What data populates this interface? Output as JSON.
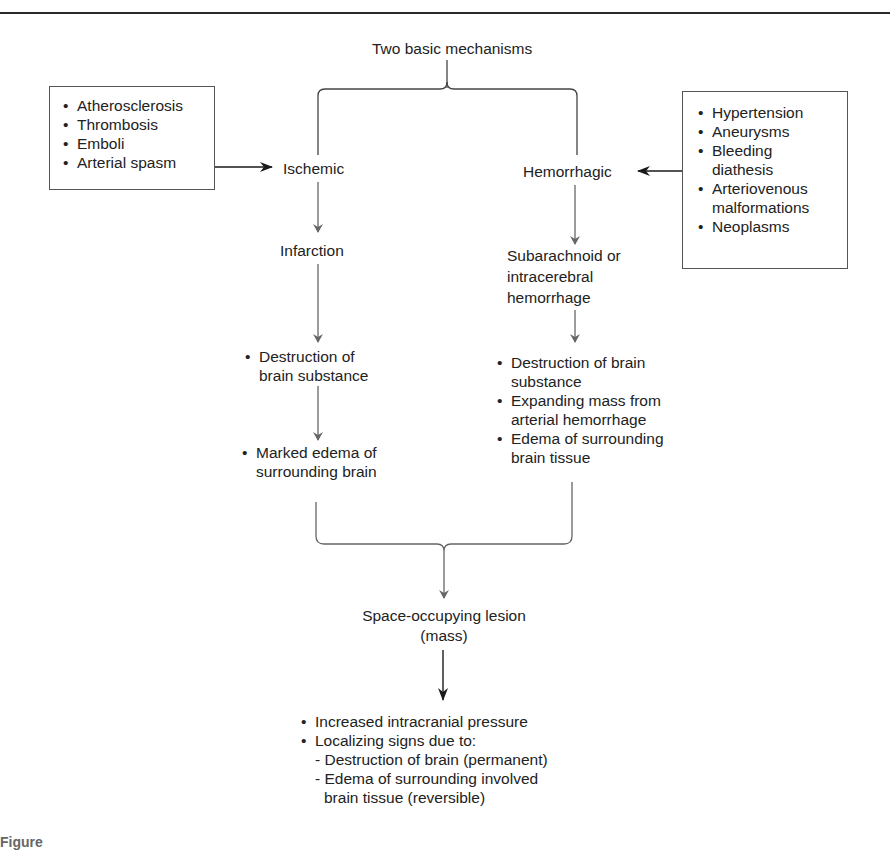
{
  "diagram": {
    "root": "Two basic mechanisms",
    "ischemic": {
      "causes": [
        "Atherosclerosis",
        "Thrombosis",
        "Emboli",
        "Arterial spasm"
      ],
      "label": "Ischemic",
      "step1": "Infarction",
      "step2": [
        "Destruction of",
        "brain substance"
      ],
      "step3": [
        "Marked edema of",
        "surrounding brain"
      ]
    },
    "hemorrhagic": {
      "causes": [
        [
          "Hypertension"
        ],
        [
          "Aneurysms"
        ],
        [
          "Bleeding",
          "diathesis"
        ],
        [
          "Arteriovenous",
          "malformations"
        ],
        [
          "Neoplasms"
        ]
      ],
      "label": "Hemorrhagic",
      "step1": [
        "Subarachnoid or",
        "intracerebral",
        "hemorrhage"
      ],
      "step2": [
        [
          "Destruction of brain",
          "substance"
        ],
        [
          "Expanding mass from",
          "arterial hemorrhage"
        ],
        [
          "Edema of surrounding",
          "brain tissue"
        ]
      ]
    },
    "convergence": [
      "Space-occupying lesion",
      "(mass)"
    ],
    "outcomes": {
      "bullet1": "Increased intracranial pressure",
      "bullet2": "Localizing signs due to:",
      "sub1": "- Destruction of brain (permanent)",
      "sub2": [
        "- Edema of surrounding involved",
        "brain tissue (reversible)"
      ]
    }
  },
  "caption_partial": "Figure",
  "colors": {
    "text": "#222222",
    "lines": "#666666",
    "black_arrows": "#1a1a1a"
  }
}
